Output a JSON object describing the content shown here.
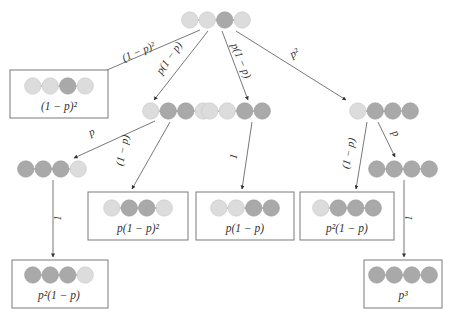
{
  "colors": {
    "light": "#dcdcdc",
    "dark": "#a9a9a9",
    "bond": "#8a8a8a",
    "edge": "#555555",
    "box_border": "#7a7a7a"
  },
  "nodes": [
    {
      "id": "root",
      "states": [
        "L",
        "L",
        "D",
        "L"
      ],
      "cx": 216,
      "cy": 20,
      "boxed": false
    },
    {
      "id": "leaf1",
      "states": [
        "L",
        "L",
        "D",
        "L"
      ],
      "cx": 59,
      "cy": 86,
      "boxed": true,
      "box": [
        10,
        70,
        98,
        48
      ],
      "label": "(1 − p)²"
    },
    {
      "id": "nA",
      "states": [
        "L",
        "D",
        "D",
        "L"
      ],
      "cx": 177,
      "cy": 111,
      "boxed": false
    },
    {
      "id": "nB",
      "states": [
        "L",
        "L",
        "D",
        "D"
      ],
      "cx": 236,
      "cy": 111,
      "boxed": false
    },
    {
      "id": "nC",
      "states": [
        "L",
        "D",
        "D",
        "D"
      ],
      "cx": 384,
      "cy": 111,
      "boxed": false
    },
    {
      "id": "nAp",
      "states": [
        "D",
        "D",
        "D",
        "L"
      ],
      "cx": 52,
      "cy": 169,
      "boxed": false
    },
    {
      "id": "leaf2",
      "states": [
        "L",
        "D",
        "D",
        "L"
      ],
      "cx": 138,
      "cy": 208,
      "boxed": true,
      "box": [
        88,
        192,
        100,
        48
      ],
      "label": "p(1 − p)²"
    },
    {
      "id": "leaf3",
      "states": [
        "L",
        "L",
        "D",
        "D"
      ],
      "cx": 245,
      "cy": 208,
      "boxed": true,
      "box": [
        196,
        192,
        98,
        48
      ],
      "label": "p(1 − p)"
    },
    {
      "id": "leaf4",
      "states": [
        "L",
        "D",
        "D",
        "D"
      ],
      "cx": 347,
      "cy": 208,
      "boxed": true,
      "box": [
        300,
        192,
        94,
        48
      ],
      "label": "p²(1 − p)"
    },
    {
      "id": "nCp",
      "states": [
        "D",
        "D",
        "D",
        "D"
      ],
      "cx": 403,
      "cy": 169,
      "boxed": false
    },
    {
      "id": "leaf5",
      "states": [
        "D",
        "D",
        "D",
        "L"
      ],
      "cx": 59,
      "cy": 275,
      "boxed": true,
      "box": [
        12,
        260,
        96,
        48
      ],
      "label": "p²(1 − p)"
    },
    {
      "id": "leaf6",
      "states": [
        "D",
        "D",
        "D",
        "D"
      ],
      "cx": 403,
      "cy": 275,
      "boxed": true,
      "box": [
        364,
        260,
        78,
        48
      ],
      "label": "p³"
    }
  ],
  "edges": [
    {
      "from": "root",
      "to": "leaf1",
      "x1": 200,
      "y1": 30,
      "x2": 100,
      "y2": 73,
      "label": "(1 − p)²",
      "lx": 140,
      "ly": 55,
      "rot": -23
    },
    {
      "from": "root",
      "to": "nA",
      "x1": 208,
      "y1": 31,
      "x2": 154,
      "y2": 100,
      "label": "p(1 − p)",
      "lx": 172,
      "ly": 60,
      "rot": -55
    },
    {
      "from": "root",
      "to": "nB",
      "x1": 222,
      "y1": 31,
      "x2": 248,
      "y2": 100,
      "label": "p(1 − p)",
      "lx": 238,
      "ly": 62,
      "rot": 68
    },
    {
      "from": "root",
      "to": "nC",
      "x1": 236,
      "y1": 31,
      "x2": 346,
      "y2": 100,
      "label": "p²",
      "lx": 296,
      "ly": 56,
      "rot": -30
    },
    {
      "from": "nA",
      "to": "nAp",
      "x1": 155,
      "y1": 121,
      "x2": 74,
      "y2": 158,
      "label": "p",
      "lx": 93,
      "ly": 135,
      "rot": -25
    },
    {
      "from": "nA",
      "to": "leaf2",
      "x1": 170,
      "y1": 122,
      "x2": 132,
      "y2": 189,
      "label": "(1 − p)",
      "lx": 126,
      "ly": 151,
      "rot": -78
    },
    {
      "from": "nB",
      "to": "leaf3",
      "x1": 252,
      "y1": 122,
      "x2": 242,
      "y2": 189,
      "label": "1",
      "lx": 237,
      "ly": 157,
      "rot": -80
    },
    {
      "from": "nC",
      "to": "leaf4",
      "x1": 367,
      "y1": 122,
      "x2": 356,
      "y2": 189,
      "label": "(1 − p)",
      "lx": 352,
      "ly": 154,
      "rot": -78
    },
    {
      "from": "nC",
      "to": "nCp",
      "x1": 378,
      "y1": 122,
      "x2": 395,
      "y2": 157,
      "label": "p",
      "lx": 393,
      "ly": 135,
      "rot": 62
    },
    {
      "from": "nAp",
      "to": "leaf5",
      "x1": 53,
      "y1": 180,
      "x2": 53,
      "y2": 257,
      "label": "1",
      "lx": 61,
      "ly": 218,
      "rot": -90
    },
    {
      "from": "nCp",
      "to": "leaf6",
      "x1": 404,
      "y1": 180,
      "x2": 404,
      "y2": 257,
      "label": "1",
      "lx": 412,
      "ly": 218,
      "rot": -90
    }
  ]
}
